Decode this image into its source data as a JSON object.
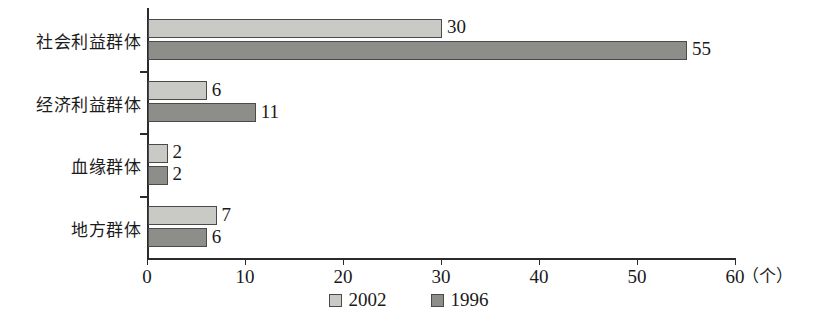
{
  "chart_data": {
    "type": "bar",
    "orientation": "horizontal",
    "title": "",
    "xlabel": "（个）",
    "ylabel": "",
    "xlim": [
      0,
      60
    ],
    "xticks": [
      0,
      10,
      20,
      30,
      40,
      50,
      60
    ],
    "xtick_labels": [
      "0",
      "10",
      "20",
      "30",
      "40",
      "50",
      "60"
    ],
    "grid": false,
    "legend_position": "bottom-center",
    "categories": [
      "社会利益群体",
      "经济利益群体",
      "血缘群体",
      "地方群体"
    ],
    "series": [
      {
        "name": "2002",
        "color": "#c9c9c5",
        "values": [
          30,
          6,
          2,
          7
        ]
      },
      {
        "name": "1996",
        "color": "#8d8d89",
        "values": [
          55,
          11,
          2,
          6
        ]
      }
    ],
    "data_labels": {
      "社会利益群体": {
        "2002": "30",
        "1996": "55"
      },
      "经济利益群体": {
        "2002": "6",
        "1996": "11"
      },
      "血缘群体": {
        "2002": "2",
        "1996": "2"
      },
      "地方群体": {
        "2002": "7",
        "1996": "6"
      }
    }
  },
  "legend": {
    "items": [
      {
        "label": "2002",
        "swatch": "light-gray-swatch"
      },
      {
        "label": "1996",
        "swatch": "dark-gray-swatch"
      }
    ]
  },
  "axis": {
    "unit_annotation": "（个）"
  }
}
